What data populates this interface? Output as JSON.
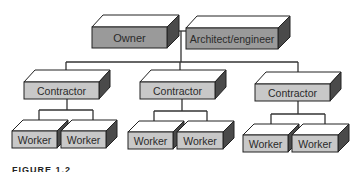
{
  "diagram": {
    "type": "organization-chart",
    "colors": {
      "owner_front": "#9a9a9a",
      "architect_front": "#9a9a9a",
      "contractor_front": "#c8c8c8",
      "worker_front": "#c8c8c8",
      "top_face": "#ffffff",
      "side_face": "#4a4a4a",
      "line": "#333333",
      "text": "#2a2a2a"
    },
    "nodes": {
      "owner": {
        "label": "Owner"
      },
      "architect": {
        "label": "Architect/engineer"
      },
      "contractors": [
        {
          "label": "Contractor"
        },
        {
          "label": "Contractor"
        },
        {
          "label": "Contractor"
        }
      ],
      "workers": [
        {
          "label": "Worker"
        },
        {
          "label": "Worker"
        },
        {
          "label": "Worker"
        },
        {
          "label": "Worker"
        },
        {
          "label": "Worker"
        },
        {
          "label": "Worker"
        }
      ]
    },
    "caption": "FIGURE 1.2"
  }
}
